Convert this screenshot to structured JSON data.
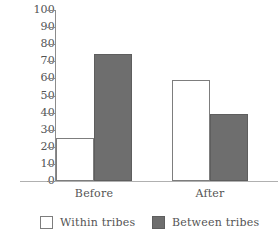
{
  "chart_data": {
    "type": "bar",
    "title": "",
    "xlabel": "",
    "ylabel": "",
    "ylim": [
      0,
      100
    ],
    "ytick_step": 10,
    "yticks": [
      100,
      90,
      80,
      70,
      60,
      50,
      40,
      30,
      20,
      10,
      0
    ],
    "ytick_labels": [
      "100",
      "90",
      "80",
      "70",
      "60",
      "50",
      "40",
      "30",
      "20",
      "10",
      "0"
    ],
    "categories": [
      "Before",
      "After"
    ],
    "grid": false,
    "legend_position": "bottom",
    "series": [
      {
        "name": "Within tribes",
        "color": "#ffffff",
        "edge_color": "#7d7d7d",
        "values": [
          25,
          59
        ]
      },
      {
        "name": "Between tribes",
        "color": "#6e6e6e",
        "edge_color": "#5e5e5e",
        "values": [
          74,
          39
        ]
      }
    ]
  },
  "legend": {
    "items": [
      {
        "label": "Within tribes"
      },
      {
        "label": "Between tribes"
      }
    ]
  },
  "axis": {
    "line_color": "#8c8c8c",
    "baseline_color": "#b0b0b0"
  }
}
